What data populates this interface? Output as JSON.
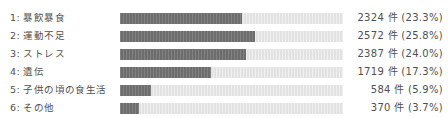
{
  "chart_data": {
    "type": "bar",
    "orientation": "horizontal",
    "title": "",
    "xlabel": "",
    "ylabel": "",
    "grid": false,
    "legend": false,
    "unit_suffix": "件",
    "axis_max_percent": 100,
    "bar_scale_percent": 42.5,
    "categories": [
      "1: 暴飲暴食",
      "2: 運動不足",
      "3: ストレス",
      "4: 遺伝",
      "5: 子供の頃の食生活",
      "6: その他"
    ],
    "values": [
      2324,
      2572,
      2387,
      1719,
      584,
      370
    ],
    "percents": [
      23.3,
      25.8,
      24.0,
      17.3,
      5.9,
      3.7
    ],
    "value_labels": [
      "2324 件 (23.3%)",
      "2572 件 (25.8%)",
      "2387 件 (24.0%)",
      "1719 件 (17.3%)",
      "584 件 (5.9%)",
      "370 件 (3.7%)"
    ],
    "colors": {
      "bar_fill": "#6d6d6d",
      "bar_track": "#e2e2e2",
      "text": "#4f4f4f",
      "background": "#ffffff"
    }
  },
  "rows": [
    {
      "label": "1: 暴飲暴食",
      "value_label": "2324 件 (23.3%)",
      "percent": 23.3
    },
    {
      "label": "2: 運動不足",
      "value_label": "2572 件 (25.8%)",
      "percent": 25.8
    },
    {
      "label": "3: ストレス",
      "value_label": "2387 件 (24.0%)",
      "percent": 24.0
    },
    {
      "label": "4: 遺伝",
      "value_label": "1719 件 (17.3%)",
      "percent": 17.3
    },
    {
      "label": "5: 子供の頃の食生活",
      "value_label": "584 件 (5.9%)",
      "percent": 5.9
    },
    {
      "label": "6: その他",
      "value_label": "370 件 (3.7%)",
      "percent": 3.7
    }
  ]
}
